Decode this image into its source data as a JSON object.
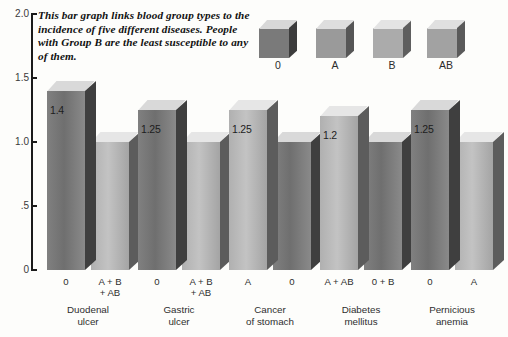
{
  "caption": "This bar graph links blood group types to the incidence of five different diseases. People with Group B are the least susceptible to any of them.",
  "legend": {
    "items": [
      {
        "label": "0",
        "color": "#7a7a7a",
        "top": "#d8d8d8",
        "side": "#3c3c3c"
      },
      {
        "label": "A",
        "color": "#9a9a9a",
        "top": "#dedede",
        "side": "#565656"
      },
      {
        "label": "B",
        "color": "#ababab",
        "top": "#e4e4e4",
        "side": "#5e5e5e"
      },
      {
        "label": "AB",
        "color": "#a2a2a2",
        "top": "#e0e0e0",
        "side": "#5a5a5a"
      }
    ]
  },
  "chart_data": {
    "type": "bar",
    "title": "",
    "xlabel": "",
    "ylabel": "",
    "ylim": [
      0,
      2.0
    ],
    "yticks": [
      "0",
      ".5",
      "1.0",
      "1.5",
      "2.0"
    ],
    "ytick_values": [
      0,
      0.5,
      1.0,
      1.5,
      2.0
    ],
    "grid": false,
    "legend_position": "top-right",
    "categories": [
      "Duodenal ulcer",
      "Gastric ulcer",
      "Cancer of stomach",
      "Diabetes mellitus",
      "Pernicious anemia"
    ],
    "groups": [
      {
        "disease_line1": "Duodenal",
        "disease_line2": "ulcer",
        "bars": [
          {
            "blood_group_line1": "0",
            "blood_group_line2": "",
            "value": 1.4,
            "value_label": "1.4",
            "shade": "dark"
          },
          {
            "blood_group_line1": "A + B",
            "blood_group_line2": "+ AB",
            "value": 1.0,
            "value_label": "",
            "shade": "light"
          }
        ]
      },
      {
        "disease_line1": "Gastric",
        "disease_line2": "ulcer",
        "bars": [
          {
            "blood_group_line1": "0",
            "blood_group_line2": "",
            "value": 1.25,
            "value_label": "1.25",
            "shade": "dark"
          },
          {
            "blood_group_line1": "A + B",
            "blood_group_line2": "+ AB",
            "value": 1.0,
            "value_label": "",
            "shade": "light"
          }
        ]
      },
      {
        "disease_line1": "Cancer",
        "disease_line2": "of stomach",
        "bars": [
          {
            "blood_group_line1": "A",
            "blood_group_line2": "",
            "value": 1.25,
            "value_label": "1.25",
            "shade": "light"
          },
          {
            "blood_group_line1": "0",
            "blood_group_line2": "",
            "value": 1.0,
            "value_label": "",
            "shade": "dark"
          }
        ]
      },
      {
        "disease_line1": "Diabetes",
        "disease_line2": "mellitus",
        "bars": [
          {
            "blood_group_line1": "A + AB",
            "blood_group_line2": "",
            "value": 1.2,
            "value_label": "1.2",
            "shade": "light"
          },
          {
            "blood_group_line1": "0 + B",
            "blood_group_line2": "",
            "value": 1.0,
            "value_label": "",
            "shade": "dark"
          }
        ]
      },
      {
        "disease_line1": "Pernicious",
        "disease_line2": "anemia",
        "bars": [
          {
            "blood_group_line1": "0",
            "blood_group_line2": "",
            "value": 1.25,
            "value_label": "1.25",
            "shade": "dark"
          },
          {
            "blood_group_line1": "A",
            "blood_group_line2": "",
            "value": 1.0,
            "value_label": "",
            "shade": "light"
          }
        ]
      }
    ]
  },
  "colors": {
    "background": "#fdfdfb",
    "axis": "#1b1b1b",
    "bar_dark_face": "#808080",
    "bar_dark_top": "#d9d9d9",
    "bar_dark_side": "#3f3f3f",
    "bar_light_face": "#b0b0b0",
    "bar_light_top": "#e6e6e6",
    "bar_light_side": "#5c5c5c",
    "text": "#2b2b2b"
  }
}
